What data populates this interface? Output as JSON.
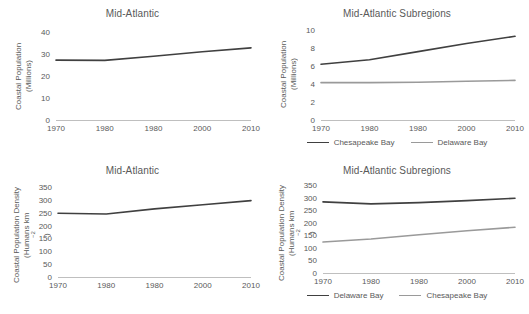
{
  "colors": {
    "dark_series": "#404040",
    "light_series": "#9a9a9a",
    "axis": "#bfbfbf",
    "text": "#595959",
    "background": "#ffffff"
  },
  "panels": {
    "top_left": {
      "title": "Mid-Atlantic",
      "ylabel_line1": "Coastal Population",
      "ylabel_line2": "(Millions)"
    },
    "top_right": {
      "title": "Mid-Atlantic Subregions",
      "ylabel_line1": "Coastal Population",
      "ylabel_line2": "(Millions)"
    },
    "bottom_left": {
      "title": "Mid-Atlantic",
      "ylabel_line1": "Coastal Population Density",
      "ylabel_line2_pre": "(Humans km",
      "ylabel_line2_sup": "−2",
      "ylabel_line2_post": ")"
    },
    "bottom_right": {
      "title": "Mid-Atlantic Subregions",
      "ylabel_line1": "Coastal Population Density",
      "ylabel_line2_pre": "(Humans km",
      "ylabel_line2_sup": "−2",
      "ylabel_line2_post": ")"
    }
  },
  "chart_data": [
    {
      "id": "top_left",
      "type": "line",
      "title": "Mid-Atlantic",
      "xlabel": "",
      "ylabel": "Coastal Population (Millions)",
      "categories": [
        "1970",
        "1980",
        "1980",
        "2000",
        "2010"
      ],
      "yticks": [
        0,
        10,
        20,
        30,
        40
      ],
      "ylim": [
        0,
        40
      ],
      "grid": false,
      "legend": "none",
      "series": [
        {
          "name": "Mid-Atlantic",
          "color": "#404040",
          "values": [
            27.2,
            27.1,
            29.0,
            31.0,
            32.8
          ]
        }
      ]
    },
    {
      "id": "top_right",
      "type": "line",
      "title": "Mid-Atlantic Subregions",
      "xlabel": "",
      "ylabel": "Coastal Population (Millions)",
      "categories": [
        "1970",
        "1980",
        "1980",
        "2000",
        "2010"
      ],
      "yticks": [
        0,
        2,
        4,
        6,
        8,
        10
      ],
      "ylim": [
        0,
        10
      ],
      "grid": false,
      "legend": "bottom",
      "series": [
        {
          "name": "Chesapeake Bay",
          "color": "#404040",
          "values": [
            6.2,
            6.7,
            7.6,
            8.5,
            9.3
          ]
        },
        {
          "name": "Delaware Bay",
          "color": "#9a9a9a",
          "values": [
            4.15,
            4.15,
            4.2,
            4.3,
            4.4
          ]
        }
      ]
    },
    {
      "id": "bottom_left",
      "type": "line",
      "title": "Mid-Atlantic",
      "xlabel": "",
      "ylabel": "Coastal Population Density (Humans km−2)",
      "categories": [
        "1970",
        "1980",
        "1980",
        "2000",
        "2010"
      ],
      "yticks": [
        0,
        50,
        100,
        150,
        200,
        250,
        300,
        350
      ],
      "ylim": [
        0,
        350
      ],
      "grid": false,
      "legend": "none",
      "series": [
        {
          "name": "Mid-Atlantic",
          "color": "#404040",
          "values": [
            248,
            245,
            265,
            281,
            297
          ]
        }
      ]
    },
    {
      "id": "bottom_right",
      "type": "line",
      "title": "Mid-Atlantic Subregions",
      "xlabel": "",
      "ylabel": "Coastal Population Density (Humans km−2)",
      "categories": [
        "1970",
        "1980",
        "1980",
        "2000",
        "2010"
      ],
      "yticks": [
        0,
        50,
        100,
        150,
        200,
        250,
        300,
        350
      ],
      "ylim": [
        0,
        350
      ],
      "grid": false,
      "legend": "bottom",
      "series": [
        {
          "name": "Delaware Bay",
          "color": "#404040",
          "values": [
            283,
            275,
            280,
            288,
            297
          ]
        },
        {
          "name": "Chesapeake Bay",
          "color": "#9a9a9a",
          "values": [
            123,
            135,
            152,
            168,
            182
          ]
        }
      ]
    }
  ]
}
